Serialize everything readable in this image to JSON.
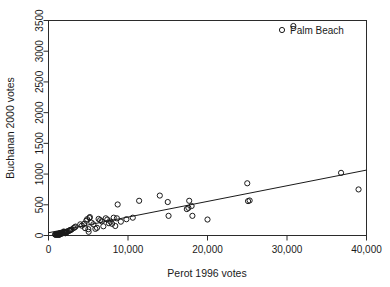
{
  "chart_data": {
    "type": "scatter",
    "title": "",
    "xlabel": "Perot 1996 votes",
    "ylabel": "Buchanan 2000 votes",
    "xlim": [
      0,
      40000
    ],
    "ylim": [
      0,
      3500
    ],
    "xticks": [
      0,
      10000,
      20000,
      30000,
      40000
    ],
    "xticklabels": [
      "0",
      "10,000",
      "20,000",
      "30,000",
      "40,000"
    ],
    "yticks": [
      0,
      500,
      1000,
      1500,
      2000,
      2500,
      3000,
      3500
    ],
    "yticklabels": [
      "0",
      "500",
      "1000",
      "1500",
      "2000",
      "2500",
      "3000",
      "3500"
    ],
    "grid": false,
    "legend": {
      "position": "top-right",
      "entries": [
        {
          "label": "Palm Beach",
          "marker": "open-circle"
        }
      ]
    },
    "marker": "open-circle",
    "marker_radius_px": 2.6,
    "series": [
      {
        "name": "Florida counties",
        "points": [
          [
            1316,
            9
          ],
          [
            1169,
            22
          ],
          [
            2082,
            38
          ],
          [
            1053,
            21
          ],
          [
            2718,
            90
          ],
          [
            1435,
            29
          ],
          [
            2313,
            55
          ],
          [
            1378,
            16
          ],
          [
            1920,
            65
          ],
          [
            1056,
            19
          ],
          [
            823,
            17
          ],
          [
            1220,
            27
          ],
          [
            2164,
            38
          ],
          [
            1664,
            32
          ],
          [
            1425,
            24
          ],
          [
            1803,
            41
          ],
          [
            2153,
            47
          ],
          [
            1141,
            18
          ],
          [
            1287,
            26
          ],
          [
            900,
            12
          ],
          [
            1992,
            47
          ],
          [
            1558,
            36
          ],
          [
            2443,
            69
          ],
          [
            1050,
            22
          ],
          [
            1740,
            34
          ],
          [
            1390,
            25
          ],
          [
            1960,
            52
          ],
          [
            1120,
            20
          ],
          [
            1310,
            28
          ],
          [
            2600,
            77
          ],
          [
            2004,
            53
          ],
          [
            1605,
            35
          ],
          [
            1260,
            23
          ],
          [
            915,
            14
          ],
          [
            2750,
            86
          ],
          [
            2260,
            58
          ],
          [
            1480,
            30
          ],
          [
            1720,
            40
          ],
          [
            1040,
            18
          ],
          [
            1190,
            21
          ],
          [
            2900,
            97
          ],
          [
            3150,
            120
          ],
          [
            3407,
            145
          ],
          [
            3300,
            133
          ],
          [
            4000,
            182
          ],
          [
            4200,
            160
          ],
          [
            4470,
            189
          ],
          [
            4600,
            120
          ],
          [
            4750,
            240
          ],
          [
            4860,
            265
          ],
          [
            5010,
            103
          ],
          [
            5050,
            60
          ],
          [
            5150,
            285
          ],
          [
            5200,
            300
          ],
          [
            5400,
            210
          ],
          [
            5640,
            182
          ],
          [
            5900,
            108
          ],
          [
            6100,
            125
          ],
          [
            6300,
            270
          ],
          [
            6500,
            250
          ],
          [
            6700,
            230
          ],
          [
            6900,
            150
          ],
          [
            7200,
            280
          ],
          [
            7400,
            260
          ],
          [
            7600,
            200
          ],
          [
            7800,
            225
          ],
          [
            8000,
            190
          ],
          [
            8200,
            290
          ],
          [
            8400,
            155
          ],
          [
            8600,
            280
          ],
          [
            8700,
            505
          ],
          [
            9100,
            225
          ],
          [
            9800,
            265
          ],
          [
            10600,
            290
          ],
          [
            11400,
            565
          ],
          [
            14000,
            650
          ],
          [
            15000,
            545
          ],
          [
            15100,
            320
          ],
          [
            17400,
            430
          ],
          [
            17600,
            450
          ],
          [
            18000,
            480
          ],
          [
            18100,
            320
          ],
          [
            17700,
            565
          ],
          [
            20000,
            260
          ],
          [
            25000,
            850
          ],
          [
            25100,
            560
          ],
          [
            25300,
            570
          ],
          [
            36800,
            1020
          ],
          [
            39000,
            750
          ]
        ]
      },
      {
        "name": "Palm Beach",
        "points": [
          [
            30800,
            3410
          ]
        ],
        "note": "highlighted county in legend"
      }
    ],
    "fit_line": {
      "type": "linear",
      "x0": 0,
      "y0": 45,
      "x1": 40000,
      "y1": 1065,
      "description": "least-squares line through non-Palm-Beach counties"
    }
  },
  "legend_text": {
    "palm_beach": "Palm Beach"
  },
  "axis_titles": {
    "x": "Perot 1996 votes",
    "y": "Buchanan 2000 votes"
  },
  "colors": {
    "background": "#ffffff",
    "ink": "#1a1a1a",
    "frame": "#2b2b2b"
  }
}
